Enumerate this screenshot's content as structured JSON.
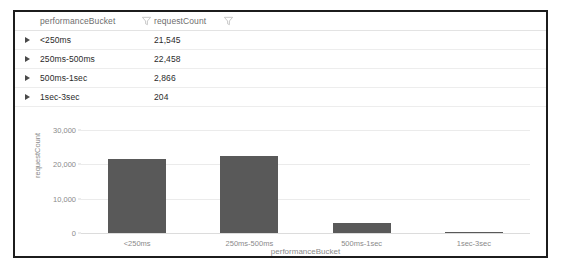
{
  "table": {
    "columns": [
      {
        "label": "performanceBucket",
        "filter_icon": "filter-funnel-icon"
      },
      {
        "label": "requestCount",
        "filter_icon": "filter-funnel-icon"
      }
    ],
    "expander_glyph": "›",
    "rows": [
      {
        "bucket": "<250ms",
        "count": "21,545"
      },
      {
        "bucket": "250ms-500ms",
        "count": "22,458"
      },
      {
        "bucket": "500ms-1sec",
        "count": "2,866"
      },
      {
        "bucket": "1sec-3sec",
        "count": "204"
      }
    ]
  },
  "chart_data": {
    "type": "bar",
    "title": "",
    "xlabel": "performanceBucket",
    "ylabel": "requestCount",
    "categories": [
      "<250ms",
      "250ms-500ms",
      "500ms-1sec",
      "1sec-3sec"
    ],
    "values": [
      21545,
      22458,
      2866,
      204
    ],
    "ylim": [
      0,
      30000
    ],
    "yticks": [
      0,
      10000,
      20000,
      30000
    ],
    "ytick_labels": [
      "0",
      "10,000",
      "20,000",
      "30,000"
    ],
    "grid": true,
    "legend": false,
    "bar_color": "#595959"
  },
  "colors": {
    "panel_border": "#1c1c1c",
    "bar": "#595959",
    "gridline": "#ebebeb",
    "axis_text": "#8a8a8a",
    "table_text": "#2b2b2b",
    "header_text": "#6e6e6e"
  }
}
